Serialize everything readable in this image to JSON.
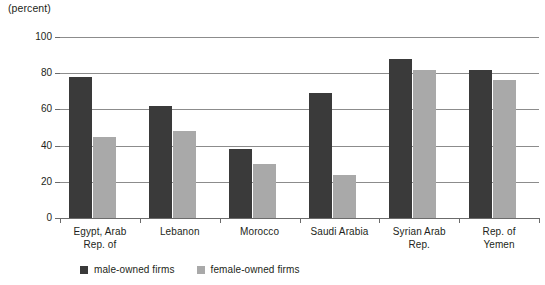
{
  "unit_title": "(percent)",
  "axis": {
    "y_title": "% of firms",
    "y_ticks": [
      "0",
      "20",
      "40",
      "60",
      "80",
      "100"
    ]
  },
  "legend": {
    "items": [
      {
        "key": "male",
        "label": "male-owned firms",
        "color": "#3a3a3a"
      },
      {
        "key": "female",
        "label": "female-owned firms",
        "color": "#a9a9a9"
      }
    ]
  },
  "categories_display": [
    [
      "Egypt, Arab",
      "Rep. of"
    ],
    [
      "Lebanon"
    ],
    [
      "Morocco"
    ],
    [
      "Saudi Arabia"
    ],
    [
      "Syrian Arab",
      "Rep."
    ],
    [
      "Rep. of",
      "Yemen"
    ]
  ],
  "chart_data": {
    "type": "bar",
    "title": "",
    "subtitle": "",
    "xlabel": "",
    "ylabel": "% of firms",
    "unit_note": "(percent)",
    "ylim": [
      0,
      100
    ],
    "yticks": [
      0,
      20,
      40,
      60,
      80,
      100
    ],
    "grid": true,
    "legend_position": "bottom-left",
    "categories": [
      "Egypt, Arab Rep. of",
      "Lebanon",
      "Morocco",
      "Saudi Arabia",
      "Syrian Arab Rep.",
      "Rep. of Yemen"
    ],
    "series": [
      {
        "name": "male-owned firms",
        "color": "#3a3a3a",
        "values": [
          78,
          62,
          38,
          69,
          88,
          82
        ]
      },
      {
        "name": "female-owned firms",
        "color": "#a9a9a9",
        "values": [
          45,
          48,
          30,
          24,
          82,
          76
        ]
      }
    ]
  }
}
